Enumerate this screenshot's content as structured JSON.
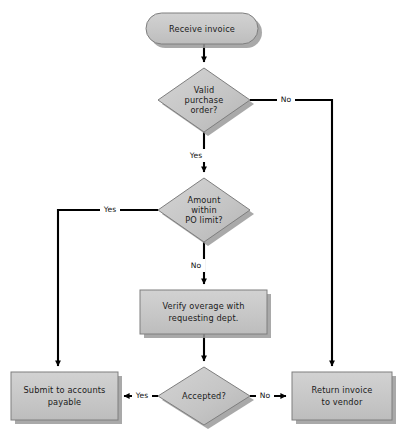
{
  "diagram": {
    "type": "flowchart",
    "canvas": {
      "width": 402,
      "height": 442,
      "background": "#ffffff"
    },
    "style": {
      "shape_fill": "#c6c6c6",
      "shape_fill_light": "#cfcfcf",
      "shape_stroke": "#7e7e7e",
      "shadow_color": "#9a9a9a",
      "connector_color": "#000000",
      "text_color": "#1a1a1a"
    },
    "nodes": [
      {
        "id": "receive-invoice",
        "shape": "terminator",
        "label": "Receive invoice",
        "lines": [
          "Receive invoice"
        ],
        "x": 146,
        "y": 13,
        "w": 112,
        "h": 31
      },
      {
        "id": "valid-purchase-order",
        "shape": "decision",
        "label": "Valid purchase order?",
        "lines": [
          "Valid",
          "purchase",
          "order?"
        ],
        "x": 158,
        "y": 68,
        "w": 92,
        "h": 64
      },
      {
        "id": "amount-within-po-limit",
        "shape": "decision",
        "label": "Amount within PO limit?",
        "lines": [
          "Amount",
          "within",
          "PO limit?"
        ],
        "x": 158,
        "y": 178,
        "w": 92,
        "h": 64
      },
      {
        "id": "verify-overage",
        "shape": "process",
        "label": "Verify overage with requesting dept.",
        "lines": [
          "Verify overage with",
          "requesting dept."
        ],
        "x": 140,
        "y": 290,
        "w": 127,
        "h": 44
      },
      {
        "id": "accepted",
        "shape": "decision",
        "label": "Accepted?",
        "lines": [
          "Accepted?"
        ],
        "x": 158,
        "y": 367,
        "w": 92,
        "h": 58
      },
      {
        "id": "submit-to-accounts-payable",
        "shape": "process",
        "label": "Submit to accounts payable",
        "lines": [
          "Submit to accounts",
          "payable"
        ],
        "x": 11,
        "y": 372,
        "w": 107,
        "h": 48
      },
      {
        "id": "return-invoice-to-vendor",
        "shape": "process",
        "label": "Return invoice to vendor",
        "lines": [
          "Return invoice",
          "to vendor"
        ],
        "x": 292,
        "y": 372,
        "w": 100,
        "h": 48
      }
    ],
    "edges": [
      {
        "id": "e1",
        "from": "receive-invoice",
        "to": "valid-purchase-order",
        "label": ""
      },
      {
        "id": "e2",
        "from": "valid-purchase-order",
        "to": "return-invoice-to-vendor",
        "label": "No"
      },
      {
        "id": "e3",
        "from": "valid-purchase-order",
        "to": "amount-within-po-limit",
        "label": "Yes"
      },
      {
        "id": "e4",
        "from": "amount-within-po-limit",
        "to": "submit-to-accounts-payable",
        "label": "Yes"
      },
      {
        "id": "e5",
        "from": "amount-within-po-limit",
        "to": "verify-overage",
        "label": "No"
      },
      {
        "id": "e6",
        "from": "verify-overage",
        "to": "accepted",
        "label": ""
      },
      {
        "id": "e7",
        "from": "accepted",
        "to": "submit-to-accounts-payable",
        "label": "Yes"
      },
      {
        "id": "e8",
        "from": "accepted",
        "to": "return-invoice-to-vendor",
        "label": "No"
      }
    ],
    "edge_labels": {
      "no_top": "No",
      "yes_top": "Yes",
      "yes_mid": "Yes",
      "no_mid": "No",
      "yes_bottom": "Yes",
      "no_bottom": "No"
    }
  }
}
